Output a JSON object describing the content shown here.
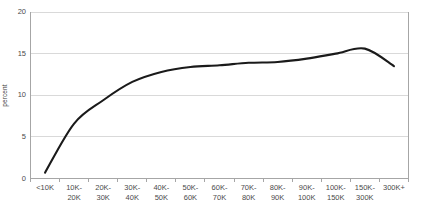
{
  "chart_data": {
    "type": "line",
    "title": "",
    "subtitle": "",
    "xlabel": "",
    "ylabel": "percent",
    "categories": [
      "<10K",
      "10K-\n20K",
      "20K-\n30K",
      "30K-\n40K",
      "40K-\n50K",
      "50K-\n60K",
      "60K-\n70K",
      "70K-\n80K",
      "80K-\n90K",
      "90K-\n100K",
      "100K-\n150K",
      "150K-\n300K",
      "300K+"
    ],
    "values": [
      0.7,
      6.6,
      9.4,
      11.6,
      12.8,
      13.4,
      13.6,
      13.9,
      14.0,
      14.4,
      15.0,
      15.6,
      13.5
    ],
    "ylim": [
      0,
      20
    ],
    "y_ticks": [
      0,
      5,
      10,
      15,
      20
    ],
    "y_tick_labels": [
      "0",
      "5",
      "10",
      "15",
      "20"
    ],
    "grid": true,
    "grid_axis": "y",
    "legend": false,
    "legend_position": "none",
    "series_color": "#1a1a1a",
    "series_width": 2.1,
    "grid_color": "#d9d9d9",
    "axis_color": "#a6a6a6",
    "background": "#ffffff",
    "smooth": true,
    "annotations": []
  },
  "watermark": {
    "text": ""
  }
}
